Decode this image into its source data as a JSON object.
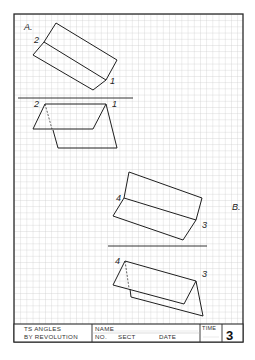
{
  "sheet": {
    "grid_color": "#c8c8c8",
    "line_color": "#1e1e1e",
    "border_color": "#2a2a2a"
  },
  "problem_a": {
    "label": "A.",
    "point_labels": [
      "2",
      "1"
    ],
    "front_labels": [
      "2",
      "1"
    ]
  },
  "problem_b": {
    "label": "B.",
    "point_labels": [
      "4",
      "3"
    ],
    "front_labels": [
      "4",
      "3"
    ]
  },
  "title_block": {
    "title_line1": "TS ANGLES",
    "title_line2": "BY REVOLUTION",
    "name_label": "NAME",
    "no_label": "NO.",
    "sect_label": "SECT",
    "date_label": "DATE",
    "time_label": "TIME",
    "sheet_number": "3"
  }
}
